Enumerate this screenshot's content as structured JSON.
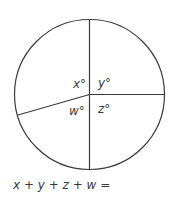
{
  "diagram": {
    "type": "circle-divided-into-angles",
    "stroke_color": "#3a3a3a",
    "circle": {
      "cx": 89.5,
      "cy": 94.5,
      "r": 75
    },
    "angle_labels": [
      {
        "id": "x",
        "text": "x°",
        "position": "upper-left"
      },
      {
        "id": "y",
        "text": "y°",
        "position": "upper-right"
      },
      {
        "id": "z",
        "text": "z°",
        "position": "lower-right"
      },
      {
        "id": "w",
        "text": "w°",
        "position": "lower-left"
      }
    ],
    "labels": {
      "x": "x°",
      "y": "y°",
      "z": "z°",
      "w": "w°"
    },
    "equation": "x + y + z + w ="
  }
}
